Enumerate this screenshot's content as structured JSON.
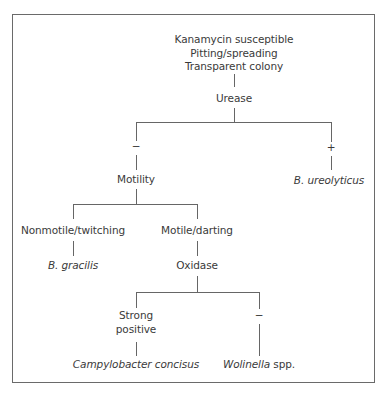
{
  "diagram": {
    "root": {
      "lines": [
        "Kanamycin susceptible",
        "Pitting/spreading",
        "Transparent colony"
      ]
    },
    "test1": {
      "label": "Urease"
    },
    "urease_neg": {
      "sign": "−"
    },
    "urease_pos": {
      "sign": "+"
    },
    "result_ureolyticus": {
      "genus": "B.",
      "species": "ureolyticus"
    },
    "test2": {
      "label": "Motility"
    },
    "motility_nonmotile": {
      "label": "Nonmotile/twitching"
    },
    "motility_motile": {
      "label": "Motile/darting"
    },
    "result_gracilis": {
      "genus": "B.",
      "species": "gracilis"
    },
    "test3": {
      "label": "Oxidase"
    },
    "oxidase_strong": {
      "lines": [
        "Strong",
        "positive"
      ]
    },
    "oxidase_neg": {
      "sign": "−"
    },
    "result_campylobacter": {
      "text": "Campylobacter concisus"
    },
    "result_wolinella": {
      "genus": "Wolinella",
      "suffix": " spp."
    }
  },
  "colors": {
    "text": "#3a3a3a",
    "lines": "#666666",
    "frame": "#6a6a6a"
  }
}
